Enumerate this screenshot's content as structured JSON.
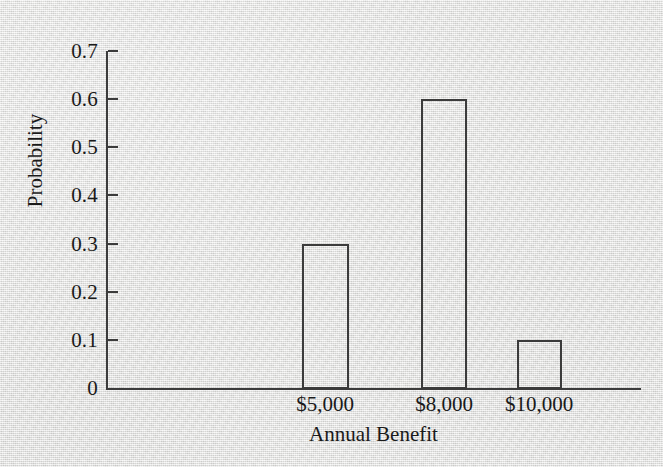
{
  "chart_data": {
    "type": "bar",
    "title": "",
    "xlabel": "Annual Benefit",
    "ylabel": "Probability",
    "categories": [
      "$5,000",
      "$8,000",
      "$10,000"
    ],
    "values": [
      0.3,
      0.6,
      0.1
    ],
    "series": [
      {
        "name": "Probability",
        "values": [
          0.3,
          0.6,
          0.1
        ]
      }
    ],
    "ylim": [
      0,
      0.7
    ],
    "ytick_labels": [
      "0",
      "0.1",
      "0.2",
      "0.3",
      "0.4",
      "0.5",
      "0.6",
      "0.7"
    ],
    "ytick_values": [
      0,
      0.1,
      0.2,
      0.3,
      0.4,
      0.5,
      0.6,
      0.7
    ],
    "grid": false,
    "legend": false,
    "legend_position": "none",
    "bar_style": "outlined-hollow",
    "annotations": []
  },
  "style": {
    "background_color": "#e9e9e7",
    "ink_color": "#3b3b3b",
    "text_color": "#1a1a1a"
  }
}
